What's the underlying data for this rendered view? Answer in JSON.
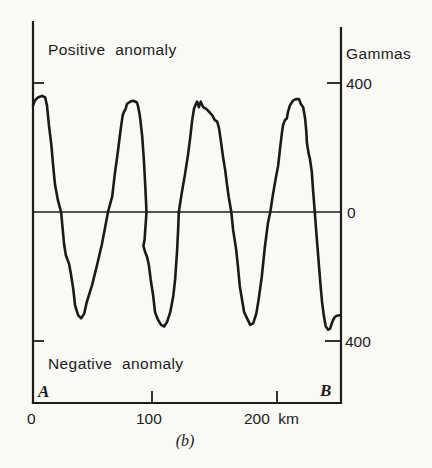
{
  "figure": {
    "caption": "(b)",
    "colors": {
      "ink": "#1a1a1a",
      "paper": "#faf9f6"
    },
    "labels": {
      "positive_anomaly": "Positive anomaly",
      "negative_anomaly": "Negative anomaly",
      "gammas": "Gammas",
      "y_plus_400": "400",
      "y_zero": "0",
      "y_minus_400": "400",
      "x_0": "0",
      "x_100": "100",
      "x_200": "200 km",
      "endpoint_a": "A",
      "endpoint_b": "B"
    }
  },
  "chart_data": {
    "type": "line",
    "title": "",
    "xlabel": "km",
    "ylabel": "Gammas",
    "xlim": [
      0,
      252
    ],
    "ylim": [
      -450,
      450
    ],
    "x_ticks": [
      0,
      100,
      200
    ],
    "y_ticks": [
      400,
      0,
      -400
    ],
    "grid": false,
    "legend": "none",
    "annotations": [
      "Positive anomaly",
      "Negative anomaly",
      "A",
      "B",
      "(b)"
    ],
    "series": [
      {
        "name": "magnetic-anomaly-profile",
        "units": {
          "x": "km",
          "y": "gammas"
        },
        "points": [
          [
            0,
            330
          ],
          [
            1.5,
            345
          ],
          [
            4,
            355
          ],
          [
            7.5,
            360
          ],
          [
            10,
            355
          ],
          [
            11.5,
            330
          ],
          [
            13,
            270
          ],
          [
            15,
            210
          ],
          [
            16.5,
            145
          ],
          [
            18,
            85
          ],
          [
            20.5,
            35
          ],
          [
            23,
            0
          ],
          [
            25.5,
            -100
          ],
          [
            27,
            -135
          ],
          [
            29.5,
            -160
          ],
          [
            31,
            -190
          ],
          [
            33,
            -240
          ],
          [
            34.5,
            -290
          ],
          [
            37,
            -320
          ],
          [
            39.5,
            -330
          ],
          [
            42,
            -315
          ],
          [
            44,
            -280
          ],
          [
            48.5,
            -225
          ],
          [
            52.5,
            -165
          ],
          [
            56.5,
            -100
          ],
          [
            59,
            -50
          ],
          [
            61.5,
            0
          ],
          [
            65,
            50
          ],
          [
            67,
            115
          ],
          [
            69.5,
            185
          ],
          [
            71.5,
            245
          ],
          [
            72.5,
            275
          ],
          [
            73.5,
            300
          ],
          [
            74.5,
            310
          ],
          [
            76,
            320
          ],
          [
            77,
            335
          ],
          [
            79.5,
            342
          ],
          [
            82,
            345
          ],
          [
            85,
            340
          ],
          [
            86,
            330
          ],
          [
            87.5,
            300
          ],
          [
            89.5,
            235
          ],
          [
            91,
            155
          ],
          [
            92,
            85
          ],
          [
            93,
            0
          ],
          [
            91.5,
            -85
          ],
          [
            90.5,
            -105
          ],
          [
            92,
            -125
          ],
          [
            93.5,
            -140
          ],
          [
            95,
            -165
          ],
          [
            96.5,
            -210
          ],
          [
            98.5,
            -260
          ],
          [
            100,
            -310
          ],
          [
            101,
            -320
          ],
          [
            102.5,
            -335
          ],
          [
            105,
            -350
          ],
          [
            107.5,
            -355
          ],
          [
            110,
            -340
          ],
          [
            112.5,
            -310
          ],
          [
            115,
            -260
          ],
          [
            116.5,
            -210
          ],
          [
            118,
            -125
          ],
          [
            119,
            -50
          ],
          [
            119.5,
            0
          ],
          [
            122,
            60
          ],
          [
            124.5,
            115
          ],
          [
            127,
            175
          ],
          [
            129,
            235
          ],
          [
            130.5,
            285
          ],
          [
            132,
            320
          ],
          [
            133.5,
            335
          ],
          [
            134.5,
            342
          ],
          [
            136,
            325
          ],
          [
            137.5,
            342
          ],
          [
            139.5,
            325
          ],
          [
            142,
            320
          ],
          [
            144.5,
            310
          ],
          [
            147,
            300
          ],
          [
            149,
            285
          ],
          [
            151,
            280
          ],
          [
            152.5,
            260
          ],
          [
            154,
            220
          ],
          [
            156,
            165
          ],
          [
            157.5,
            130
          ],
          [
            159,
            85
          ],
          [
            160.5,
            45
          ],
          [
            162.5,
            0
          ],
          [
            164,
            -55
          ],
          [
            166.5,
            -115
          ],
          [
            168,
            -170
          ],
          [
            169.5,
            -230
          ],
          [
            171.5,
            -275
          ],
          [
            173,
            -310
          ],
          [
            175.5,
            -330
          ],
          [
            178,
            -350
          ],
          [
            180.5,
            -345
          ],
          [
            183,
            -315
          ],
          [
            185,
            -270
          ],
          [
            187.5,
            -200
          ],
          [
            190,
            -110
          ],
          [
            192.5,
            -35
          ],
          [
            194.5,
            0
          ],
          [
            196.5,
            50
          ],
          [
            199,
            105
          ],
          [
            201,
            145
          ],
          [
            202.5,
            195
          ],
          [
            204,
            245
          ],
          [
            205,
            270
          ],
          [
            206.5,
            285
          ],
          [
            208,
            290
          ],
          [
            209,
            310
          ],
          [
            210.5,
            330
          ],
          [
            213,
            345
          ],
          [
            215.5,
            350
          ],
          [
            218,
            350
          ],
          [
            219.5,
            335
          ],
          [
            221.5,
            325
          ],
          [
            223,
            290
          ],
          [
            224,
            250
          ],
          [
            224.5,
            215
          ],
          [
            226,
            180
          ],
          [
            227,
            165
          ],
          [
            228.5,
            125
          ],
          [
            229.5,
            70
          ],
          [
            231,
            0
          ],
          [
            232,
            -50
          ],
          [
            233.5,
            -125
          ],
          [
            235,
            -195
          ],
          [
            236,
            -240
          ],
          [
            237,
            -280
          ],
          [
            238.5,
            -325
          ],
          [
            240,
            -355
          ],
          [
            242,
            -365
          ],
          [
            243.5,
            -362
          ],
          [
            244.5,
            -350
          ],
          [
            246,
            -335
          ],
          [
            247.5,
            -325
          ],
          [
            249,
            -322
          ],
          [
            251.5,
            -320
          ]
        ]
      }
    ]
  }
}
